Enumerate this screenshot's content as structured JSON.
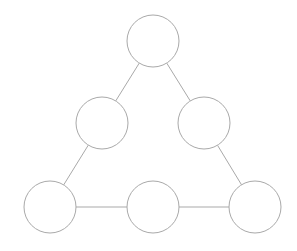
{
  "diagram": {
    "type": "triangle-node-graph",
    "stroke_color": "#a9a9a9",
    "fill_color": "#ffffff",
    "background": "#ffffff",
    "node_radius": 26,
    "nodes": [
      {
        "id": "top",
        "cx": 153,
        "cy": 41,
        "label": ""
      },
      {
        "id": "middle-left",
        "cx": 102,
        "cy": 123,
        "label": ""
      },
      {
        "id": "middle-right",
        "cx": 204,
        "cy": 123,
        "label": ""
      },
      {
        "id": "bottom-left",
        "cx": 50,
        "cy": 207,
        "label": ""
      },
      {
        "id": "bottom-middle",
        "cx": 153,
        "cy": 207,
        "label": ""
      },
      {
        "id": "bottom-right",
        "cx": 255,
        "cy": 207,
        "label": ""
      }
    ],
    "edges": [
      {
        "from": "top",
        "to": "middle-left"
      },
      {
        "from": "top",
        "to": "middle-right"
      },
      {
        "from": "middle-left",
        "to": "bottom-left"
      },
      {
        "from": "middle-right",
        "to": "bottom-right"
      },
      {
        "from": "bottom-left",
        "to": "bottom-middle"
      },
      {
        "from": "bottom-middle",
        "to": "bottom-right"
      }
    ]
  }
}
